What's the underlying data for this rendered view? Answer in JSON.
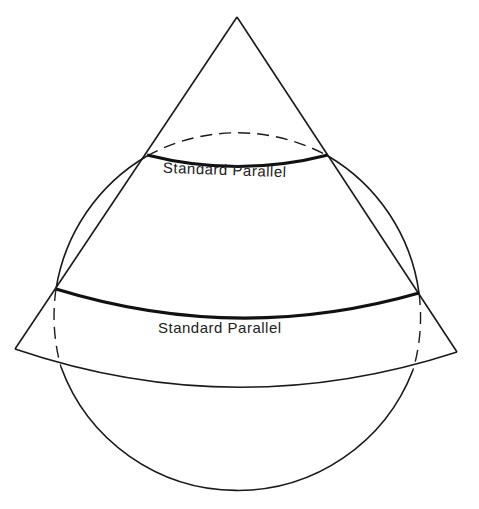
{
  "diagram": {
    "labels": {
      "upper_parallel": "Standard Parallel",
      "lower_parallel": "Standard Parallel"
    },
    "colors": {
      "line": "#1a1a1a",
      "background": "#ffffff"
    }
  }
}
